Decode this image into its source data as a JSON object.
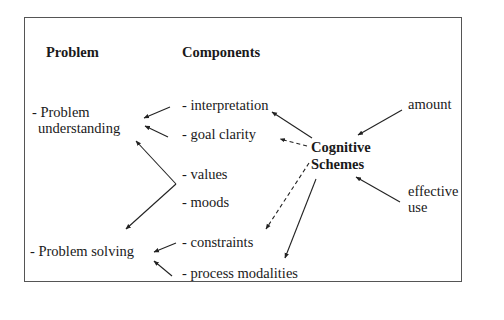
{
  "diagram": {
    "headers": {
      "problem": "Problem",
      "components": "Components"
    },
    "problems": [
      {
        "line1": "- Problem",
        "line2": "understanding"
      },
      {
        "line1": "- Problem solving"
      }
    ],
    "components": [
      "- interpretation",
      "- goal clarity",
      "- values",
      "- moods",
      "- constraints",
      "- process modalities"
    ],
    "center": {
      "line1": "Cognitive",
      "line2": "Schemes"
    },
    "inputs": [
      {
        "line1": "amount"
      },
      {
        "line1": "effective",
        "line2": "use"
      }
    ],
    "edges": [
      {
        "from": "- interpretation",
        "to": "- Problem understanding",
        "style": "solid"
      },
      {
        "from": "- goal clarity",
        "to": "- Problem understanding",
        "style": "solid"
      },
      {
        "from": "- values / - moods",
        "to": "- Problem understanding",
        "style": "solid"
      },
      {
        "from": "- values / - moods",
        "to": "- Problem solving",
        "style": "solid"
      },
      {
        "from": "- constraints",
        "to": "- Problem solving",
        "style": "solid"
      },
      {
        "from": "- process modalities",
        "to": "- Problem solving",
        "style": "solid"
      },
      {
        "from": "Cognitive Schemes",
        "to": "- interpretation",
        "style": "solid"
      },
      {
        "from": "Cognitive Schemes",
        "to": "- goal clarity",
        "style": "dashed"
      },
      {
        "from": "Cognitive Schemes",
        "to": "- constraints",
        "style": "dashed"
      },
      {
        "from": "Cognitive Schemes",
        "to": "- process modalities",
        "style": "solid"
      },
      {
        "from": "amount",
        "to": "Cognitive Schemes",
        "style": "solid"
      },
      {
        "from": "effective use",
        "to": "Cognitive Schemes",
        "style": "solid"
      }
    ]
  }
}
